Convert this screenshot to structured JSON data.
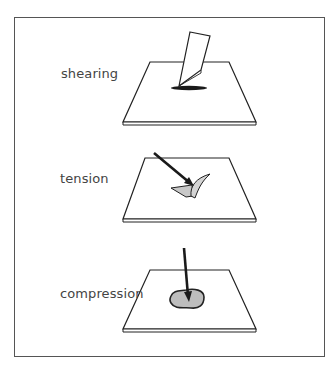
{
  "panels": [
    {
      "id": "shearing",
      "label": "shearing"
    },
    {
      "id": "tension",
      "label": "tension"
    },
    {
      "id": "compression",
      "label": "compression"
    }
  ],
  "colors": {
    "stroke": "#222222",
    "frame": "#555555",
    "label": "#444444",
    "wound_fill": "#bdbdbd",
    "flap_fill": "#cfcfcf",
    "shadow": "#1a1a1a",
    "background": "#ffffff"
  }
}
